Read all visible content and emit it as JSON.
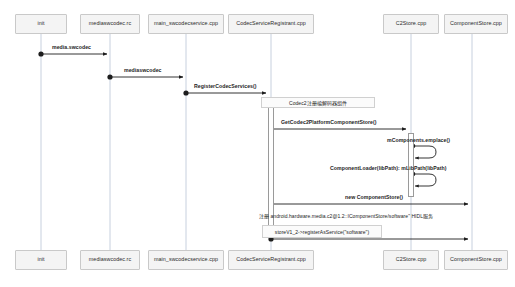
{
  "diagram": {
    "type": "uml-sequence-diagram",
    "title": "",
    "canvas": {
      "width": 515,
      "height": 287,
      "background": "#ffffff"
    },
    "colors": {
      "lifeline_box_fill": "#f4f4f4",
      "lifeline_box_border": "#c9c9c9",
      "lifeline_line": "#b9c4d6",
      "arrow": "#1d1d1d",
      "note_fill": "#fbfbfb",
      "note_border": "#d0d0d0"
    },
    "participants": [
      {
        "id": "init",
        "label": "init",
        "x": 41
      },
      {
        "id": "mediaswcodec_rc",
        "label": "mediaswcodec.rc",
        "x": 110
      },
      {
        "id": "main_swcodecservice",
        "label": "main_swcodecservice.cpp",
        "x": 186
      },
      {
        "id": "codecserviceregistrant",
        "label": "CodecServiceRegistrant.cpp",
        "x": 271
      },
      {
        "id": "c2store",
        "label": "C2Store.cpp",
        "x": 411
      },
      {
        "id": "componentstore",
        "label": "ComponentStore.cpp",
        "x": 472
      }
    ],
    "messages": [
      {
        "id": "m1",
        "label": "media.swcodec",
        "from": "init",
        "to": "mediaswcodec_rc",
        "y": 54,
        "kind": "call"
      },
      {
        "id": "m2",
        "label": "mediaswcodec",
        "from": "mediaswcodec_rc",
        "to": "main_swcodecservice",
        "y": 77,
        "kind": "call"
      },
      {
        "id": "m3",
        "label": "RegisterCodecServices()",
        "from": "main_swcodecservice",
        "to": "codecserviceregistrant",
        "y": 93,
        "kind": "call"
      },
      {
        "id": "m4",
        "label": "GetCodec2PlatformComponentStore()",
        "from": "codecserviceregistrant",
        "to": "c2store",
        "y": 129,
        "kind": "call"
      },
      {
        "id": "m5",
        "label": "mComponents.emplace()",
        "from": "c2store",
        "to": "c2store",
        "y": 148,
        "kind": "self"
      },
      {
        "id": "m6",
        "label": "ComponentLoader(libPath): mLibPath(libPath)",
        "from": "c2store",
        "to": "c2store",
        "y": 176,
        "kind": "self"
      },
      {
        "id": "m7",
        "label": "new ComponentStore()",
        "from": "codecserviceregistrant",
        "to": "componentstore",
        "y": 204,
        "kind": "call"
      },
      {
        "id": "m8",
        "label": "storeV1_2->registerAsService(\"software\")",
        "from": "codecserviceregistrant",
        "to": "componentstore",
        "y": 239,
        "kind": "call"
      }
    ],
    "notes": [
      {
        "id": "n1",
        "text": "Codec2注册编解码器组件",
        "x": 261,
        "y": 97,
        "width": 114,
        "height": 11,
        "style": "box"
      },
      {
        "id": "n2",
        "text": "注册 android.hardware.media.c2@1.2::IComponentStore/software\" HIDL服务",
        "x": 259,
        "y": 212,
        "width": 178,
        "height": 9,
        "style": "plain"
      },
      {
        "id": "n3",
        "text": "storeV1_2->registerAsService(\"software\")",
        "x": 262,
        "y": 225,
        "width": 120,
        "height": 13,
        "style": "box"
      }
    ],
    "activations": [
      {
        "id": "a1",
        "on": "codecserviceregistrant",
        "x": 268,
        "y": 100,
        "width": 6,
        "height": 136
      },
      {
        "id": "a2",
        "on": "c2store",
        "x": 408,
        "y": 133,
        "width": 6,
        "height": 64
      }
    ]
  }
}
